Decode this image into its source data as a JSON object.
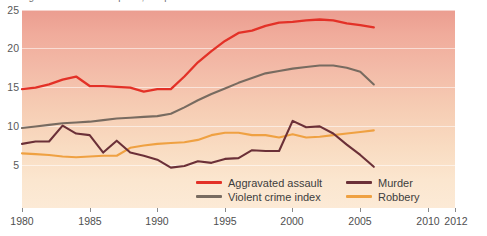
{
  "top_caption": "Figure — crime rates per 1,000 persons",
  "colors": {
    "aggravated_assault": "#e33127",
    "violent_crime_index": "#786b60",
    "murder": "#6b3038",
    "robbery": "#efa142",
    "panel_top": "#eb9d90",
    "panel_bottom": "#fcead6",
    "gridline": "#ffffff",
    "axis_text": "#4f4f4f"
  },
  "axes": {
    "y_ticks": [
      25,
      20,
      15,
      10,
      5
    ],
    "y_min": 0,
    "y_max": 25,
    "x_ticks": [
      1980,
      1985,
      1990,
      1995,
      2000,
      2005,
      2010,
      2012
    ],
    "x_min": 1980,
    "x_max": 2012,
    "grid": true
  },
  "legend": {
    "position": "inside-bottom-center",
    "entries": [
      {
        "label": "Aggravated assault",
        "color": "#e33127"
      },
      {
        "label": "Murder",
        "color": "#6b3038"
      },
      {
        "label": "Violent crime index",
        "color": "#786b60"
      },
      {
        "label": "Robbery",
        "color": "#efa142"
      }
    ]
  },
  "chart_data": {
    "type": "line",
    "title": "",
    "xlabel": "",
    "ylabel": "",
    "xlim": [
      1980,
      2012
    ],
    "ylim": [
      0,
      25
    ],
    "x": [
      1980,
      1981,
      1982,
      1983,
      1984,
      1985,
      1986,
      1987,
      1988,
      1989,
      1990,
      1991,
      1992,
      1993,
      1994,
      1995,
      1996,
      1997,
      1998,
      1999,
      2000,
      2001,
      2002,
      2003,
      2004,
      2005,
      2006
    ],
    "series": [
      {
        "name": "Aggravated assault",
        "color": "#e33127",
        "values": [
          15.0,
          15.2,
          15.6,
          16.2,
          16.6,
          15.4,
          15.4,
          15.3,
          15.2,
          14.7,
          15.0,
          15.0,
          16.6,
          18.4,
          19.8,
          21.1,
          22.1,
          22.4,
          23.0,
          23.4,
          23.5,
          23.7,
          23.8,
          23.7,
          23.3,
          23.1,
          22.8
        ],
        "units": "rate per 1,000"
      },
      {
        "name": "Violent crime index",
        "color": "#786b60",
        "values": [
          10.1,
          10.3,
          10.5,
          10.7,
          10.8,
          10.9,
          11.1,
          11.3,
          11.4,
          11.5,
          11.6,
          11.9,
          12.7,
          13.6,
          14.4,
          15.1,
          15.8,
          16.4,
          17.0,
          17.3,
          17.6,
          17.8,
          18.0,
          18.0,
          17.7,
          17.2,
          15.6
        ],
        "units": "rate per 1,000"
      },
      {
        "name": "Murder",
        "color": "#6b3038",
        "values": [
          8.1,
          8.4,
          8.4,
          10.4,
          9.4,
          9.2,
          7.0,
          8.5,
          7.0,
          6.6,
          6.1,
          5.1,
          5.3,
          5.9,
          5.7,
          6.2,
          6.3,
          7.3,
          7.2,
          7.2,
          11.0,
          10.2,
          10.3,
          9.4,
          8.0,
          6.7,
          5.2
        ],
        "units": "rate per 1,000"
      },
      {
        "name": "Robbery",
        "color": "#efa142",
        "values": [
          6.9,
          6.8,
          6.7,
          6.5,
          6.4,
          6.5,
          6.6,
          6.6,
          7.6,
          7.9,
          8.1,
          8.2,
          8.3,
          8.6,
          9.2,
          9.5,
          9.5,
          9.2,
          9.2,
          8.9,
          9.3,
          8.9,
          9.0,
          9.2,
          9.4,
          9.6,
          9.8
        ],
        "units": "rate per 1,000"
      }
    ]
  }
}
